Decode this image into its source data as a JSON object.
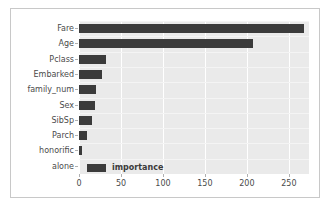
{
  "chart_data": {
    "type": "bar",
    "orientation": "horizontal",
    "title": "",
    "xlabel": "",
    "ylabel": "",
    "categories": [
      "Fare",
      "Age",
      "Pclass",
      "Embarked",
      "family_num",
      "Sex",
      "SibSp",
      "Parch",
      "honorific",
      "alone"
    ],
    "values": [
      268,
      207,
      32,
      27,
      20,
      19,
      15,
      9,
      4,
      0
    ],
    "series": [
      {
        "name": "importance",
        "values": [
          268,
          207,
          32,
          27,
          20,
          19,
          15,
          9,
          4,
          0
        ]
      }
    ],
    "xlim": [
      0,
      274
    ],
    "xticks": [
      0,
      50,
      100,
      150,
      200,
      250
    ],
    "xtick_labels": [
      "0",
      "50",
      "100",
      "150",
      "200",
      "250"
    ],
    "legend": {
      "entries": [
        "importance"
      ],
      "position": "lower-left"
    },
    "grid": true,
    "colors": {
      "bar": "#3b3b3b",
      "plot_background": "#eaeaea",
      "gridline": "#ffffff",
      "figure_background": "#ffffff",
      "figure_border": "#c8c8c8",
      "tick_text": "#4a4a4a"
    }
  }
}
